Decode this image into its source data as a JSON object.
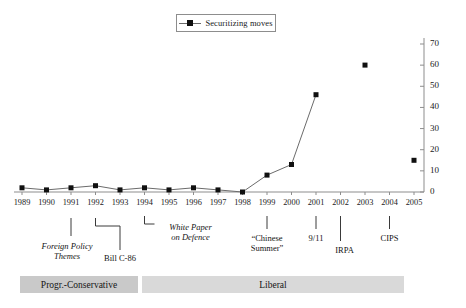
{
  "legend": {
    "label": "Securitizing moves",
    "marker": "filled-square-marker",
    "position": "top-center",
    "boxed": true
  },
  "axes": {
    "y": {
      "position": "right",
      "ticks": [
        0,
        10,
        20,
        30,
        40,
        50,
        60,
        70
      ],
      "min": 0,
      "max": 70,
      "step": 10
    },
    "x": {
      "position": "bottom",
      "ticks": [
        "1989",
        "1990",
        "1991",
        "1992",
        "1993",
        "1994",
        "1995",
        "1996",
        "1997",
        "1998",
        "1999",
        "2000",
        "2001",
        "2002",
        "2003",
        "2004",
        "2005"
      ]
    }
  },
  "annotations": [
    {
      "id": "foreign-policy-themes",
      "text": "Foreign Policy\nThemes",
      "line1": "Foreign Policy",
      "line2": "Themes",
      "year": 1991,
      "italic": true
    },
    {
      "id": "bill-c-86",
      "text": "Bill C-86",
      "line1": "Bill C-86",
      "line2": "",
      "year": 1993,
      "italic": false
    },
    {
      "id": "white-paper-on-defence",
      "text": "White Paper\non Defence",
      "line1": "White Paper",
      "line2": "on Defence",
      "year": 1994,
      "italic": true
    },
    {
      "id": "chinese-summer",
      "text": "“Chinese\nSummer”",
      "line1": "“Chinese",
      "line2": "Summer”",
      "year": 1999,
      "italic": false
    },
    {
      "id": "nine-eleven",
      "text": "9/11",
      "line1": "9/11",
      "line2": "",
      "year": 2001,
      "italic": false
    },
    {
      "id": "irpa",
      "text": "IRPA",
      "line1": "IRPA",
      "line2": "",
      "year": 2002,
      "italic": false
    },
    {
      "id": "cips",
      "text": "CIPS",
      "line1": "CIPS",
      "line2": "",
      "year": 2004,
      "italic": false
    }
  ],
  "governments": [
    {
      "id": "progr-conservative",
      "label": "Progr.-Conservative",
      "start_year": 1989,
      "end_year": 1993,
      "color": "#c9c9c9"
    },
    {
      "id": "liberal",
      "label": "Liberal",
      "start_year": 1994,
      "end_year": 2005,
      "color": "#d9d9d9"
    }
  ],
  "colors": {
    "marker": "#101010",
    "line": "#6b6b6b",
    "axis": "#8d8d8d",
    "text": "#1a1a1a",
    "pc_bar": "#c9c9c9",
    "liberal_bar": "#d9d9d9"
  },
  "chart_data": {
    "type": "line",
    "title": "",
    "subtitle": "",
    "xlabel": "",
    "ylabel": "",
    "xlim": [
      1989,
      2005
    ],
    "ylim": [
      0,
      70
    ],
    "grid": false,
    "legend_position": "top-center",
    "x": [
      1989,
      1990,
      1991,
      1992,
      1993,
      1994,
      1995,
      1996,
      1997,
      1998,
      1999,
      2000,
      2001,
      2002,
      2003,
      2004,
      2005
    ],
    "series": [
      {
        "name": "Securitizing moves",
        "marker": "square",
        "values": [
          2,
          1,
          2,
          3,
          1,
          2,
          1,
          2,
          1,
          0,
          8,
          13,
          46,
          null,
          60,
          null,
          15
        ]
      }
    ],
    "categories": [
      "1989",
      "1990",
      "1991",
      "1992",
      "1993",
      "1994",
      "1995",
      "1996",
      "1997",
      "1998",
      "1999",
      "2000",
      "2001",
      "2002",
      "2003",
      "2004",
      "2005"
    ]
  }
}
